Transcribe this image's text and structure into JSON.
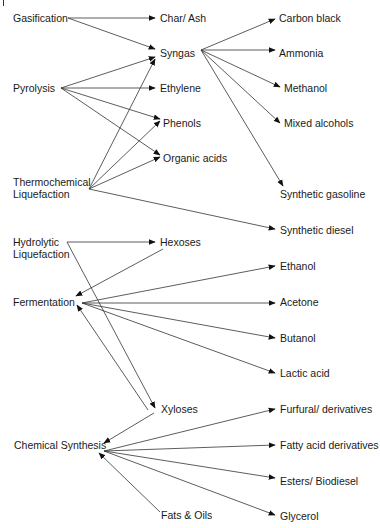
{
  "diagram": {
    "type": "flow",
    "title": "",
    "nodes": {
      "gasification": {
        "label": "Gasification",
        "x": 13,
        "y": 12
      },
      "pyrolysis": {
        "label": "Pyrolysis",
        "x": 13,
        "y": 82
      },
      "thermochemical": {
        "label": "Thermochemical",
        "label2": "Liquefaction",
        "x": 13,
        "y": 176
      },
      "hydrolytic": {
        "label": "Hydrolytic",
        "label2": "Liquefaction",
        "x": 13,
        "y": 236
      },
      "fermentation": {
        "label": "Fermentation",
        "x": 13,
        "y": 296
      },
      "chemical_synthesis": {
        "label": "Chemical Synthesis",
        "x": 14,
        "y": 439
      },
      "char_ash": {
        "label": "Char/ Ash",
        "x": 160,
        "y": 12
      },
      "syngas": {
        "label": "Syngas",
        "x": 160,
        "y": 47
      },
      "ethylene": {
        "label": "Ethylene",
        "x": 160,
        "y": 82
      },
      "phenols": {
        "label": "Phenols",
        "x": 163,
        "y": 117
      },
      "organic_acids": {
        "label": "Organic acids",
        "x": 163,
        "y": 152
      },
      "hexoses": {
        "label": "Hexoses",
        "x": 160,
        "y": 236
      },
      "xyloses": {
        "label": "Xyloses",
        "x": 161,
        "y": 403
      },
      "fats_oils": {
        "label": "Fats & Oils",
        "x": 161,
        "y": 509
      },
      "carbon_black": {
        "label": "Carbon black",
        "x": 279,
        "y": 12
      },
      "ammonia": {
        "label": "Ammonia",
        "x": 279,
        "y": 47
      },
      "methanol": {
        "label": "Methanol",
        "x": 284,
        "y": 82
      },
      "mixed_alcohols": {
        "label": "Mixed alcohols",
        "x": 284,
        "y": 117
      },
      "synthetic_gasoline": {
        "label": "Synthetic gasoline",
        "x": 280,
        "y": 188
      },
      "synthetic_diesel": {
        "label": "Synthetic diesel",
        "x": 280,
        "y": 224
      },
      "ethanol": {
        "label": "Ethanol",
        "x": 280,
        "y": 260
      },
      "acetone": {
        "label": "Acetone",
        "x": 280,
        "y": 296
      },
      "butanol": {
        "label": "Butanol",
        "x": 280,
        "y": 332
      },
      "lactic_acid": {
        "label": "Lactic acid",
        "x": 280,
        "y": 367
      },
      "furfural": {
        "label": "Furfural/ derivatives",
        "x": 280,
        "y": 403
      },
      "fatty_acid": {
        "label": "Fatty acid derivatives",
        "x": 280,
        "y": 439
      },
      "esters": {
        "label": "Esters/ Biodiesel",
        "x": 280,
        "y": 475
      },
      "glycerol": {
        "label": "Glycerol",
        "x": 280,
        "y": 510
      }
    },
    "edges": [
      {
        "from": "gasification",
        "to": "char_ash",
        "x1": 68,
        "y1": 18,
        "x2": 155,
        "y2": 18
      },
      {
        "from": "gasification",
        "to": "syngas",
        "x1": 68,
        "y1": 18,
        "x2": 155,
        "y2": 49
      },
      {
        "from": "pyrolysis",
        "to": "syngas",
        "x1": 61,
        "y1": 88,
        "x2": 155,
        "y2": 57
      },
      {
        "from": "pyrolysis",
        "to": "ethylene",
        "x1": 61,
        "y1": 88,
        "x2": 155,
        "y2": 88
      },
      {
        "from": "pyrolysis",
        "to": "phenols",
        "x1": 61,
        "y1": 88,
        "x2": 160,
        "y2": 119
      },
      {
        "from": "pyrolysis",
        "to": "organic_acids",
        "x1": 61,
        "y1": 88,
        "x2": 160,
        "y2": 155
      },
      {
        "from": "thermochemical",
        "to": "syngas",
        "x1": 89,
        "y1": 189,
        "x2": 155,
        "y2": 59
      },
      {
        "from": "thermochemical",
        "to": "phenols",
        "x1": 89,
        "y1": 189,
        "x2": 160,
        "y2": 121
      },
      {
        "from": "thermochemical",
        "to": "organic_acids",
        "x1": 89,
        "y1": 189,
        "x2": 160,
        "y2": 157
      },
      {
        "from": "thermochemical",
        "to": "synthetic_diesel",
        "x1": 89,
        "y1": 189,
        "x2": 275,
        "y2": 229
      },
      {
        "from": "syngas",
        "to": "carbon_black",
        "x1": 201,
        "y1": 50,
        "x2": 275,
        "y2": 19
      },
      {
        "from": "syngas",
        "to": "ammonia",
        "x1": 201,
        "y1": 50,
        "x2": 275,
        "y2": 50
      },
      {
        "from": "syngas",
        "to": "methanol",
        "x1": 201,
        "y1": 50,
        "x2": 280,
        "y2": 87
      },
      {
        "from": "syngas",
        "to": "mixed_alcohols",
        "x1": 201,
        "y1": 50,
        "x2": 280,
        "y2": 123
      },
      {
        "from": "syngas",
        "to": "synthetic_gasoline",
        "x1": 201,
        "y1": 50,
        "x2": 283,
        "y2": 186
      },
      {
        "from": "hydrolytic",
        "to": "hexoses",
        "x1": 67,
        "y1": 242,
        "x2": 155,
        "y2": 242
      },
      {
        "from": "hexoses",
        "to": "fermentation",
        "x1": 163,
        "y1": 249,
        "x2": 76,
        "y2": 296
      },
      {
        "from": "hydrolytic",
        "to": "xyloses",
        "x1": 67,
        "y1": 242,
        "x2": 155,
        "y2": 408
      },
      {
        "from": "xyloses",
        "to": "fermentation",
        "x1": 148,
        "y1": 410,
        "x2": 77,
        "y2": 305
      },
      {
        "from": "fermentation",
        "to": "ethanol",
        "x1": 82,
        "y1": 303,
        "x2": 275,
        "y2": 266
      },
      {
        "from": "fermentation",
        "to": "acetone",
        "x1": 82,
        "y1": 303,
        "x2": 275,
        "y2": 303
      },
      {
        "from": "fermentation",
        "to": "butanol",
        "x1": 82,
        "y1": 303,
        "x2": 275,
        "y2": 338
      },
      {
        "from": "fermentation",
        "to": "lactic_acid",
        "x1": 82,
        "y1": 303,
        "x2": 275,
        "y2": 373
      },
      {
        "from": "xyloses",
        "to": "chemical_synthesis",
        "x1": 154,
        "y1": 413,
        "x2": 104,
        "y2": 443
      },
      {
        "from": "chemical_synthesis",
        "to": "furfural",
        "x1": 104,
        "y1": 451,
        "x2": 275,
        "y2": 409
      },
      {
        "from": "chemical_synthesis",
        "to": "fatty_acid",
        "x1": 104,
        "y1": 451,
        "x2": 275,
        "y2": 445
      },
      {
        "from": "chemical_synthesis",
        "to": "esters",
        "x1": 104,
        "y1": 451,
        "x2": 275,
        "y2": 478
      },
      {
        "from": "chemical_synthesis",
        "to": "glycerol",
        "x1": 104,
        "y1": 451,
        "x2": 275,
        "y2": 515
      },
      {
        "from": "fats_oils",
        "to": "chemical_synthesis",
        "x1": 160,
        "y1": 512,
        "x2": 99,
        "y2": 453
      }
    ]
  }
}
